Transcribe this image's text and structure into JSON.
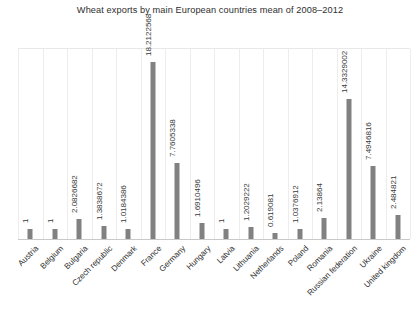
{
  "chart_data": {
    "type": "bar",
    "title": "Wheat exports by main European countries mean of 2008–2012",
    "xlabel": "",
    "ylabel": "",
    "ylim": [
      0,
      19.5
    ],
    "grid": "vertical-category-separators",
    "legend": "none",
    "bar_color": "#818181",
    "value_label_rotation": "90",
    "category_label_rotation": "45",
    "categories": [
      "Austria",
      "Belgium",
      "Bulgaria",
      "Czech republic",
      "Denmark",
      "France",
      "Germany",
      "Hungary",
      "Latvia",
      "Lithuania",
      "Netherlands",
      "Poland",
      "Romania",
      "Russian federation",
      "Ukraine",
      "United kingdom"
    ],
    "values": [
      1,
      1,
      2.0826682,
      1.3838672,
      1.0184386,
      18.2122568,
      7.7605338,
      1.6910496,
      1,
      1.2029222,
      0.619081,
      1.0376912,
      2.13864,
      14.3329002,
      7.4946816,
      2.484821
    ],
    "value_labels": [
      "1",
      "1",
      "2.0826682",
      "1.3838672",
      "1.0184386",
      "18.2122568",
      "7.7605338",
      "1.6910496",
      "1",
      "1.2029222",
      "0.619081",
      "1.0376912",
      "2.13864",
      "14.3329002",
      "7.4946816",
      "2.484821"
    ]
  }
}
